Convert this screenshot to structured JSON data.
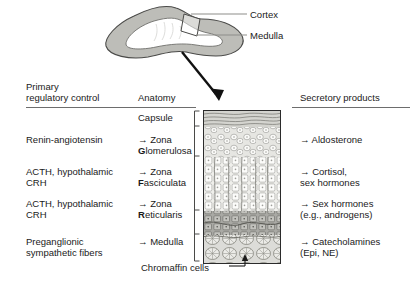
{
  "figure": {
    "organ_labels": [
      {
        "name": "cortex",
        "text": "Cortex"
      },
      {
        "name": "medulla",
        "text": "Medulla"
      }
    ]
  },
  "headers": {
    "primary": "Primary\nregulatory control",
    "anatomy": "Anatomy",
    "secretory": "Secretory products"
  },
  "rows": [
    {
      "control": "",
      "anatomy": "Capsule",
      "product": ""
    },
    {
      "control": "Renin-angiotensin",
      "anatomy_prefix": "→ Zona\n",
      "anatomy_bold": "G",
      "anatomy_rest": "lomerulosa",
      "product": "→ Aldosterone"
    },
    {
      "control": "ACTH, hypothalamic\nCRH",
      "anatomy_prefix": "→ Zona\n",
      "anatomy_bold": "F",
      "anatomy_rest": "asciculata",
      "product": "→ Cortisol,\n   sex hormones"
    },
    {
      "control": "ACTH, hypothalamic\nCRH",
      "anatomy_prefix": "→ Zona\n",
      "anatomy_bold": "R",
      "anatomy_rest": "eticularis",
      "product": "→ Sex hormones\n   (e.g., androgens)"
    },
    {
      "control": "Preganglionic\nsympathetic fibers",
      "anatomy": "→ Medulla",
      "product": "→ Catecholamines\n   (Epi, NE)"
    }
  ],
  "annotations": {
    "chromaffin": "Chromaffin cells"
  },
  "colors": {
    "ink": "#1a1a1a",
    "rule": "#6d6d6d",
    "histo_border": "#2b2b2b",
    "capsule": "#cfcfca",
    "glomerulosa": "#e3e3df",
    "fasciculata": "#ebebe7",
    "reticularis": "#a9a9a4",
    "medulla": "#dcdcd8",
    "gland_cortex": "#bdbdb8",
    "gland_medulla": "#ffffff"
  }
}
